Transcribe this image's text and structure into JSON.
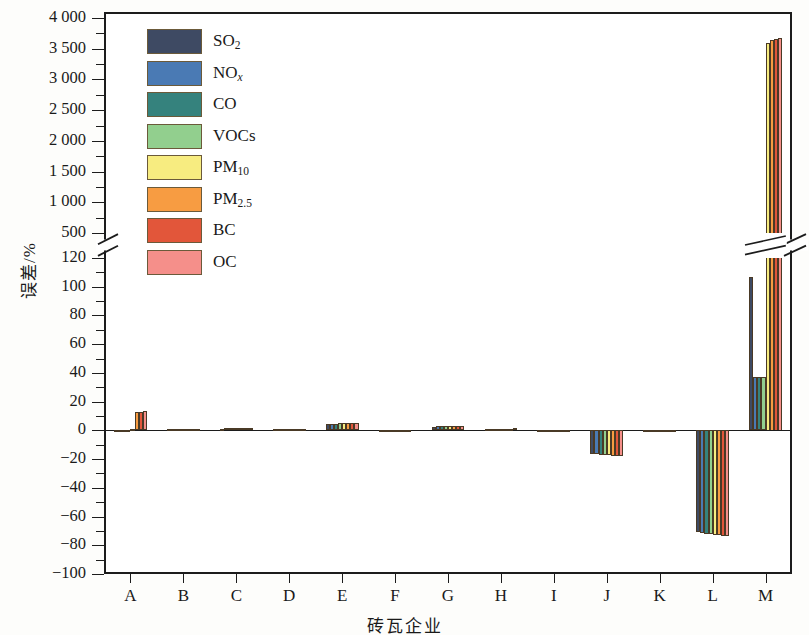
{
  "chart_data": {
    "type": "bar",
    "title": "",
    "xlabel": "砖瓦企业",
    "ylabel": "误差/%",
    "grid": false,
    "legend_position": "top-left",
    "broken_axis": true,
    "axis_segments": [
      {
        "name": "lower",
        "ylim": [
          -100,
          120
        ],
        "ticks": [
          -100,
          -80,
          -60,
          -40,
          -20,
          0,
          20,
          40,
          60,
          80,
          100,
          120
        ],
        "minor_ticks": [
          -90,
          -70,
          -50,
          -30,
          -10,
          10,
          30,
          50,
          70,
          90,
          110
        ]
      },
      {
        "name": "upper",
        "ylim": [
          500,
          4000
        ],
        "ticks": [
          500,
          1000,
          1500,
          2000,
          2500,
          3000,
          3500,
          4000
        ],
        "minor_ticks": [
          750,
          1250,
          1750,
          2250,
          2750,
          3250,
          3750
        ]
      }
    ],
    "ytick_labels_lower": [
      "-100",
      "-80",
      "-60",
      "-40",
      "-20",
      "0",
      "20",
      "40",
      "60",
      "80",
      "100",
      "120"
    ],
    "ytick_labels_upper": [
      "500",
      "1 000",
      "1 500",
      "2 000",
      "2 500",
      "3 000",
      "3 500",
      "4 000"
    ],
    "categories": [
      "A",
      "B",
      "C",
      "D",
      "E",
      "F",
      "G",
      "H",
      "I",
      "J",
      "K",
      "L",
      "M"
    ],
    "series": [
      {
        "name": "SO2",
        "label": "SO<sub>2</sub>",
        "color": "#3e4a63",
        "values": [
          0.6,
          0.8,
          1.2,
          0.7,
          4.5,
          0.3,
          2.6,
          0.9,
          0.2,
          -16.5,
          0.2,
          -71.0,
          107.0
        ]
      },
      {
        "name": "NOx",
        "label": "NO<sub><i>x</i></sub>",
        "color": "#4a7ab4",
        "values": [
          0.5,
          0.9,
          1.4,
          0.8,
          4.6,
          0.3,
          2.7,
          1.0,
          0.2,
          -16.8,
          0.2,
          -71.5,
          37.0
        ]
      },
      {
        "name": "CO",
        "label": "CO",
        "color": "#35827d",
        "values": [
          0.6,
          0.9,
          1.3,
          0.8,
          4.7,
          0.3,
          2.8,
          1.0,
          0.2,
          -17.0,
          0.2,
          -72.0,
          37.0
        ]
      },
      {
        "name": "VOCs",
        "label": "VOCs",
        "color": "#92cf8e",
        "values": [
          0.6,
          1.0,
          1.4,
          0.9,
          4.8,
          0.4,
          2.9,
          1.1,
          0.2,
          -17.2,
          0.2,
          -72.3,
          37.0
        ]
      },
      {
        "name": "PM10",
        "label": "PM<sub>10</sub>",
        "color": "#f7ec80",
        "values": [
          0.7,
          1.0,
          1.5,
          0.9,
          5.0,
          0.4,
          3.0,
          1.1,
          0.2,
          -17.4,
          0.2,
          -72.6,
          3600.0
        ]
      },
      {
        "name": "PM2.5",
        "label": "PM<sub>2.5</sub>",
        "color": "#f79c42",
        "values": [
          12.8,
          1.1,
          1.6,
          1.0,
          5.1,
          0.4,
          3.1,
          1.2,
          0.2,
          -17.6,
          0.2,
          -73.0,
          3640.0
        ]
      },
      {
        "name": "BC",
        "label": "BC",
        "color": "#e2563a",
        "values": [
          13.0,
          1.1,
          1.7,
          1.0,
          5.2,
          0.4,
          3.2,
          1.2,
          0.2,
          -17.8,
          0.2,
          -73.4,
          3660.0
        ]
      },
      {
        "name": "OC",
        "label": "OC",
        "color": "#f58f8a",
        "values": [
          13.2,
          1.2,
          1.7,
          1.1,
          5.3,
          0.5,
          3.3,
          1.3,
          0.2,
          -18.0,
          0.2,
          -73.8,
          3670.0
        ]
      }
    ]
  }
}
